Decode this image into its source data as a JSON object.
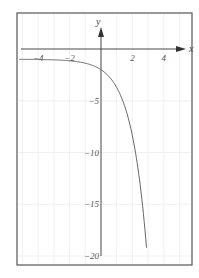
{
  "chart_data": {
    "type": "line",
    "title": "",
    "xlabel": "x",
    "ylabel": "y",
    "xlim": [
      -5.3,
      5.8
    ],
    "ylim": [
      -20.5,
      3.5
    ],
    "grid": true,
    "legend": null,
    "x_ticks": [
      -4,
      -2,
      2,
      4
    ],
    "x_tick_labels": [
      "−4",
      "−2",
      "2",
      "4"
    ],
    "y_ticks": [
      -5,
      -10,
      -15,
      -20
    ],
    "y_tick_labels": [
      "−5",
      "−10",
      "−15",
      "−20"
    ],
    "series": [
      {
        "name": "curve",
        "description": "approximately y = -e^x - 1",
        "x": [
          -5.2,
          -4,
          -3,
          -2,
          -1,
          0,
          0.5,
          1,
          1.5,
          2,
          2.5,
          2.9
        ],
        "y": [
          -1.0,
          -1.02,
          -1.05,
          -1.14,
          -1.37,
          -2.0,
          -2.65,
          -3.72,
          -5.48,
          -8.39,
          -13.18,
          -19.2
        ]
      }
    ]
  },
  "axes": {
    "x_label": "x",
    "y_label": "y"
  },
  "colors": {
    "frame": "#555555",
    "axis": "#333333",
    "curve": "#666666",
    "grid": "#eeeeee",
    "text": "#555555"
  }
}
